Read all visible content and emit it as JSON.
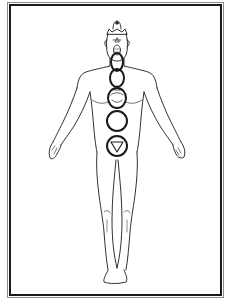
{
  "image": {
    "description": "Line-art illustration of a standing human figure with chakra circles along the spine, inside a double-line rectangular frame",
    "colors": {
      "ink": "#1a1a1a",
      "frame_outer": "#8a8a8a",
      "background": "#ffffff"
    },
    "chakras": [
      {
        "name": "crown",
        "cx": 117,
        "cy": 24
      },
      {
        "name": "third-eye",
        "cx": 117,
        "cy": 42
      },
      {
        "name": "throat",
        "cx": 117,
        "cy": 72
      },
      {
        "name": "heart",
        "cx": 117,
        "cy": 100
      },
      {
        "name": "solar-plexus",
        "cx": 117,
        "cy": 124
      },
      {
        "name": "sacral",
        "cx": 117,
        "cy": 146
      },
      {
        "name": "root",
        "cx": 117,
        "cy": 146,
        "symbol": "inverted-triangle"
      }
    ]
  }
}
